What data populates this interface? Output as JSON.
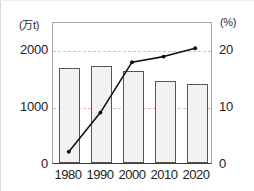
{
  "chart_data": {
    "type": "bar",
    "title": "",
    "subtitle": "",
    "xlabel": "",
    "ylabel": "(万t)",
    "y2label": "(%)",
    "categories": [
      "1980",
      "1990",
      "2000",
      "2010",
      "2020"
    ],
    "grid": true,
    "legend_position": "none",
    "axes": {
      "left": {
        "unit": "(万t)",
        "ticks": [
          "0",
          "1000",
          "2000"
        ],
        "tick_values": [
          0,
          1000,
          2000
        ],
        "ylim": [
          0,
          2500
        ]
      },
      "right": {
        "unit": "(%)",
        "ticks": [
          "0",
          "10",
          "20"
        ],
        "tick_values": [
          0,
          10,
          20
        ],
        "ylim": [
          0,
          25
        ]
      }
    },
    "series": [
      {
        "name": "bar-series",
        "type": "bar",
        "axis": "left",
        "unit": "万t",
        "values": [
          1670,
          1710,
          1620,
          1440,
          1390
        ],
        "fill_color": "#f2f2f2",
        "edge_color": "#565656"
      },
      {
        "name": "line-series",
        "type": "line",
        "axis": "right",
        "unit": "%",
        "values": [
          2.0,
          9.0,
          18.0,
          19.0,
          20.5
        ],
        "line_color": "#111111",
        "marker": "dot"
      }
    ]
  },
  "colors": {
    "bar_fill": "#f2f2f2",
    "bar_edge": "#565656",
    "line": "#111111",
    "gridline": "#e3b9b9",
    "frame": "#a9a9a9",
    "axis": "#3a3a3a",
    "text": "#232323"
  }
}
